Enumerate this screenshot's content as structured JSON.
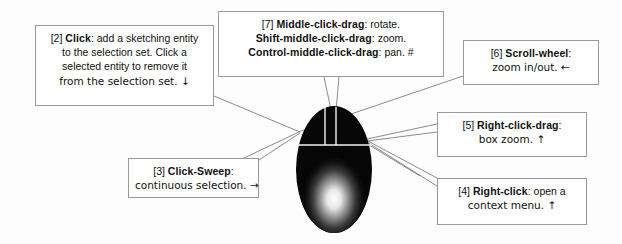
{
  "figure": {
    "background_color": "#fdfdfd",
    "box_border_color": "#9a9a9a",
    "box_background_color": "#ffffff",
    "text_color": "#111111",
    "leader_line_color": "#6e6e6e"
  },
  "callouts": [
    {
      "id": "2",
      "tag": "[2]",
      "term": "Click",
      "lines": [
        "[2] Click: add a sketching entity",
        "to the selection set.  Click a",
        "selected entity to remove it",
        "from the selection set.  ↓"
      ],
      "line1_pre": "[2] ",
      "line1_term": "Click",
      "line1_post": ": add a sketching entity",
      "line2": "to the selection set.  Click a",
      "line3": "selected entity to remove it",
      "line4": "from the selection set.  ↓",
      "arrow": "↓"
    },
    {
      "id": "7",
      "tag": "[7]",
      "term": "Middle-click-drag",
      "line1_pre": "[7] ",
      "line1_term": "Middle-click-drag",
      "line1_post": ": rotate.",
      "line2_term": "Shift-middle-click-drag",
      "line2_post": ": zoom.",
      "line3_term": "Control-middle-click-drag",
      "line3_post": ": pan.  #",
      "marker": "#"
    },
    {
      "id": "6",
      "tag": "[6]",
      "term": "Scroll-wheel",
      "line1_pre": "[6] ",
      "line1_term": "Scroll-wheel",
      "line1_post": ":",
      "line2": "zoom in/out.  ←",
      "arrow": "←"
    },
    {
      "id": "5",
      "tag": "[5]",
      "term": "Right-click-drag",
      "line1_pre": "[5] ",
      "line1_term": "Right-click-drag",
      "line1_post": ":",
      "line2": "box zoom.  ↑",
      "arrow": "↑"
    },
    {
      "id": "4",
      "tag": "[4]",
      "term": "Right-click",
      "line1_pre": "[4] ",
      "line1_term": "Right-click",
      "line1_post": ": open a",
      "line2": "context menu.  ↑",
      "arrow": "↑"
    },
    {
      "id": "3",
      "tag": "[3]",
      "term": "Click-Sweep",
      "line1_pre": "[3] ",
      "line1_term": "Click-Sweep",
      "line1_post": ":",
      "line2": "continuous selection.  →",
      "arrow": "→"
    }
  ],
  "mouse": {
    "name": "three-button-mouse",
    "body_color": "#0a0a0a",
    "divider_color": "#f2f2f2",
    "highlight_color": "#ffffff",
    "buttons": [
      "left-button",
      "middle-button",
      "right-button"
    ]
  }
}
